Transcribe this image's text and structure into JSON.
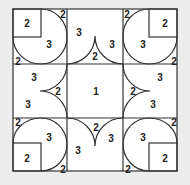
{
  "puzzle": {
    "colors": {
      "background": "#ededed",
      "paper": "#ffffff",
      "line": "#333333",
      "text": "#222222"
    },
    "labels": [
      {
        "id": "tl-square",
        "text": "2",
        "x": 27,
        "y": 23
      },
      {
        "id": "tl-big",
        "text": "3",
        "x": 49,
        "y": 44
      },
      {
        "id": "tl-corner-top",
        "text": "2",
        "x": 63,
        "y": 14
      },
      {
        "id": "tl-corner-bottom",
        "text": "2",
        "x": 18,
        "y": 61
      },
      {
        "id": "top-mid-left",
        "text": "3",
        "x": 79,
        "y": 32
      },
      {
        "id": "top-mid-center",
        "text": "2",
        "x": 95,
        "y": 56
      },
      {
        "id": "top-mid-right",
        "text": "3",
        "x": 112,
        "y": 44
      },
      {
        "id": "tr-corner-top",
        "text": "2",
        "x": 127,
        "y": 14
      },
      {
        "id": "tr-square",
        "text": "2",
        "x": 165,
        "y": 23
      },
      {
        "id": "tr-big",
        "text": "3",
        "x": 143,
        "y": 44
      },
      {
        "id": "tr-corner-bottom",
        "text": "2",
        "x": 174,
        "y": 61
      },
      {
        "id": "mid-left-top",
        "text": "3",
        "x": 34,
        "y": 77
      },
      {
        "id": "mid-left-center",
        "text": "2",
        "x": 58,
        "y": 91
      },
      {
        "id": "mid-left-bottom",
        "text": "3",
        "x": 28,
        "y": 104
      },
      {
        "id": "center",
        "text": "1",
        "x": 96,
        "y": 91
      },
      {
        "id": "mid-right-center",
        "text": "2",
        "x": 133,
        "y": 91
      },
      {
        "id": "mid-right-top",
        "text": "3",
        "x": 160,
        "y": 77
      },
      {
        "id": "mid-right-bottom",
        "text": "3",
        "x": 153,
        "y": 104
      },
      {
        "id": "bl-corner-top",
        "text": "2",
        "x": 18,
        "y": 122
      },
      {
        "id": "bl-big",
        "text": "3",
        "x": 49,
        "y": 137
      },
      {
        "id": "bl-square",
        "text": "2",
        "x": 27,
        "y": 158
      },
      {
        "id": "bl-corner-bottom",
        "text": "2",
        "x": 63,
        "y": 169
      },
      {
        "id": "bottom-mid-center",
        "text": "2",
        "x": 96,
        "y": 127
      },
      {
        "id": "bottom-mid-left",
        "text": "3",
        "x": 78,
        "y": 150
      },
      {
        "id": "bottom-mid-right",
        "text": "3",
        "x": 111,
        "y": 138
      },
      {
        "id": "br-corner-top",
        "text": "2",
        "x": 174,
        "y": 122
      },
      {
        "id": "br-big",
        "text": "3",
        "x": 143,
        "y": 137
      },
      {
        "id": "br-corner-bottom",
        "text": "2",
        "x": 128,
        "y": 169
      },
      {
        "id": "br-square",
        "text": "2",
        "x": 165,
        "y": 158
      }
    ]
  }
}
